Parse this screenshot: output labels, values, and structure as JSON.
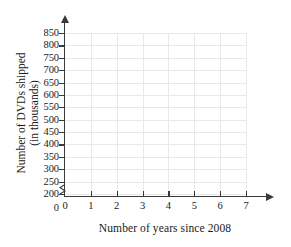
{
  "chart_data": {
    "type": "line",
    "title": "",
    "xlabel": "Number of years since 2008",
    "ylabel_line1": "Number of DVDs shipped",
    "ylabel_line2": "(in thousands)",
    "x_ticks": [
      0,
      1,
      2,
      3,
      4,
      5,
      6,
      7
    ],
    "x_tick_labels": [
      "0",
      "1",
      "2",
      "3",
      "4",
      "5",
      "6",
      "7"
    ],
    "y_ticks": [
      200,
      250,
      300,
      350,
      400,
      450,
      500,
      550,
      600,
      650,
      700,
      750,
      800,
      850
    ],
    "y_tick_labels": [
      "850",
      "800",
      "750",
      "700",
      "650",
      "600",
      "550",
      "500",
      "450",
      "400",
      "350",
      "300",
      "250",
      "200"
    ],
    "y_origin_label": "0",
    "xlim": [
      0,
      7
    ],
    "ylim": [
      200,
      850
    ],
    "y_axis_broken": true,
    "y_axis_break_between": [
      0,
      200
    ],
    "grid": true,
    "legend": false,
    "series": [],
    "values": [],
    "categories": [],
    "annotations": [],
    "colors": {
      "grid": "#e9e9e9",
      "axis": "#3a3a3a",
      "text": "#1a1a1a",
      "background": "#ffffff"
    }
  }
}
